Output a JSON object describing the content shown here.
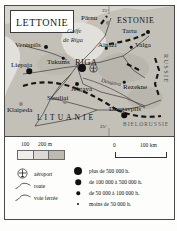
{
  "map": {
    "title": "LETTONIE",
    "countries": [
      {
        "name": "ESTONIE"
      },
      {
        "name": "LITUANIE"
      },
      {
        "name": "RUSSIE"
      },
      {
        "name": "BIELORUSSIE"
      }
    ],
    "water_labels": [
      {
        "name": "Golfe"
      },
      {
        "name": "de Riga"
      }
    ],
    "rivers": [
      {
        "name": "Daugava"
      }
    ],
    "coordinates": [
      {
        "label": "25°"
      },
      {
        "label": "25°"
      }
    ],
    "cities": [
      {
        "name": "RIGA",
        "class": "capital",
        "size": "xl"
      },
      {
        "name": "Pärnu",
        "class": "city",
        "size": "md"
      },
      {
        "name": "Tartu",
        "class": "city",
        "size": "md"
      },
      {
        "name": "Valga",
        "class": "city",
        "size": "sm"
      },
      {
        "name": "Ainaži",
        "class": "city",
        "size": "sm"
      },
      {
        "name": "Ventspils",
        "class": "city",
        "size": "md"
      },
      {
        "name": "Liepaja",
        "class": "city",
        "size": "lg"
      },
      {
        "name": "Tukums",
        "class": "city",
        "size": "sm"
      },
      {
        "name": "Jelgava",
        "class": "city",
        "size": "md"
      },
      {
        "name": "Rezekne",
        "class": "city",
        "size": "sm"
      },
      {
        "name": "Daugavpils",
        "class": "city",
        "size": "lg"
      },
      {
        "name": "Siauliai",
        "class": "city",
        "size": "md"
      },
      {
        "name": "Klaipeda",
        "class": "city",
        "size": "md"
      }
    ]
  },
  "legend": {
    "altitude_scale": {
      "tick_100": "100",
      "tick_200": "200 m"
    },
    "distance_scale": {
      "start": "0",
      "end": "100 km"
    },
    "symbols": [
      {
        "key": "airport",
        "label": "aéroport"
      },
      {
        "key": "road",
        "label": "route"
      },
      {
        "key": "railway",
        "label": "voie ferrée"
      }
    ],
    "population": [
      {
        "key": "pop-over-500k",
        "label": "plus de 500 000 h."
      },
      {
        "key": "pop-100k-500k",
        "label": "de 100 000 à 500 000 h."
      },
      {
        "key": "pop-50k-100k",
        "label": "de 50 000 à 100 000 h."
      },
      {
        "key": "pop-under-50k",
        "label": "moins de 50 000 h."
      }
    ]
  },
  "colors": {
    "land": "#bcb9b1",
    "sea": "#dedcd6",
    "border": "#4a4a4a",
    "dot": "#111111"
  }
}
